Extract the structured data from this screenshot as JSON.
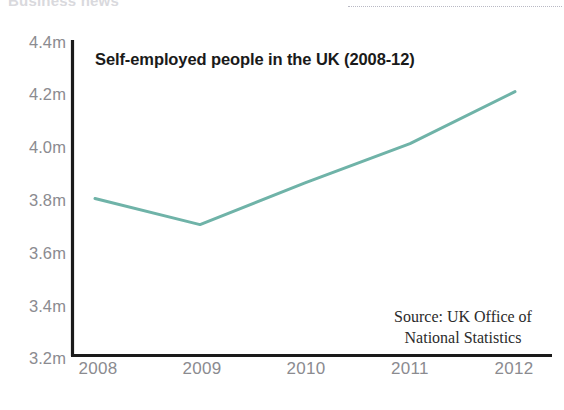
{
  "page": {
    "masthead_remnant": "Business news",
    "top_rule": "dotted-rule"
  },
  "chart_data": {
    "type": "line",
    "title": "Self-employed people in the UK (2008-12)",
    "xlabel": "",
    "ylabel": "",
    "categories": [
      "2008",
      "2009",
      "2010",
      "2011",
      "2012"
    ],
    "x": [
      2008,
      2009,
      2010,
      2011,
      2012
    ],
    "values": [
      3.8,
      3.7,
      3.86,
      4.01,
      4.21
    ],
    "value_unit": "millions",
    "ylim": [
      3.2,
      4.4
    ],
    "ytick_values": [
      4.4,
      4.2,
      4.0,
      3.8,
      3.6,
      3.4,
      3.2
    ],
    "ytick_labels": [
      "4.4m",
      "4.2m",
      "4.0m",
      "3.8m",
      "3.6m",
      "3.4m",
      "3.2m"
    ],
    "xtick_labels": [
      "2008",
      "2009",
      "2010",
      "2011",
      "2012"
    ],
    "grid": false,
    "legend": "none",
    "series": [
      {
        "name": "Self-employed people in the UK",
        "values": [
          3.8,
          3.7,
          3.86,
          4.01,
          4.21
        ],
        "color": "#6fb3a8"
      }
    ],
    "line_color": "#6fb3a8",
    "axis_color": "#1a1a1a",
    "tick_label_color": "#8b8b90",
    "annotations": [
      {
        "name": "source",
        "line1": "Source: UK Office of",
        "line2": "National Statistics"
      }
    ]
  },
  "source": {
    "line1": "Source: UK Office of",
    "line2": "National Statistics"
  }
}
